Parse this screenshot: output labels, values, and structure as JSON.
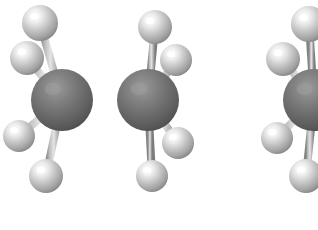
{
  "figure": {
    "kind": "molecular-ball-and-stick-render",
    "formula": "C2H6",
    "conformer_count": 2,
    "background_color": "#ffffff",
    "canvas": {
      "width": 318,
      "height": 230
    }
  },
  "palette": {
    "carbon_base": "#6a6a6a",
    "carbon_highlight": "#8e8e8e",
    "carbon_shadow": "#4a4a4a",
    "hydrogen_base": "#b6b6b6",
    "hydrogen_highlight": "#ffffff",
    "hydrogen_shadow": "#8c8c8c",
    "bond_base": "#9a9a9a",
    "bond_highlight": "#d8d8d8",
    "bond_shadow": "#6e6e6e",
    "cc_bond_base": "#7e7e7e",
    "cc_bond_highlight": "#a8a8a8"
  },
  "molecules": [
    {
      "id": "left-molecule",
      "label": "ethane-staggered-left",
      "clipped": false,
      "atoms": [
        {
          "id": "C1",
          "element": "C",
          "name": "carbon-atom-left",
          "cx": 62,
          "cy": 100,
          "r": 31
        },
        {
          "id": "C2",
          "element": "C",
          "name": "carbon-atom-right",
          "cx": 148,
          "cy": 100,
          "r": 31
        },
        {
          "id": "H1",
          "element": "H",
          "name": "hydrogen-atom-top-left",
          "cx": 40,
          "cy": 23,
          "r": 18
        },
        {
          "id": "H2",
          "element": "H",
          "name": "hydrogen-atom-upper-left",
          "cx": 27,
          "cy": 58,
          "r": 17
        },
        {
          "id": "H3",
          "element": "H",
          "name": "hydrogen-atom-lower-left",
          "cx": 19,
          "cy": 136,
          "r": 16
        },
        {
          "id": "H4",
          "element": "H",
          "name": "hydrogen-atom-bottom-left",
          "cx": 46,
          "cy": 176,
          "r": 17
        },
        {
          "id": "H5",
          "element": "H",
          "name": "hydrogen-atom-top-right",
          "cx": 155,
          "cy": 27,
          "r": 17
        },
        {
          "id": "H6",
          "element": "H",
          "name": "hydrogen-atom-upper-right",
          "cx": 176,
          "cy": 60,
          "r": 16
        },
        {
          "id": "H7",
          "element": "H",
          "name": "hydrogen-atom-lower-right",
          "cx": 178,
          "cy": 143,
          "r": 16
        },
        {
          "id": "H8",
          "element": "H",
          "name": "hydrogen-atom-bottom-right",
          "cx": 152,
          "cy": 176,
          "r": 16
        }
      ],
      "bonds": [
        {
          "id": "B-CC",
          "from": "C1",
          "to": "C2",
          "kind": "carbon-carbon",
          "width": 17
        },
        {
          "id": "B1",
          "from": "C1",
          "to": "H1",
          "kind": "carbon-hydrogen",
          "width": 8
        },
        {
          "id": "B2",
          "from": "C1",
          "to": "H2",
          "kind": "carbon-hydrogen",
          "width": 8
        },
        {
          "id": "B3",
          "from": "C1",
          "to": "H3",
          "kind": "carbon-hydrogen",
          "width": 8
        },
        {
          "id": "B4",
          "from": "C1",
          "to": "H4",
          "kind": "carbon-hydrogen",
          "width": 8
        },
        {
          "id": "B5",
          "from": "C2",
          "to": "H5",
          "kind": "carbon-hydrogen",
          "width": 8
        },
        {
          "id": "B6",
          "from": "C2",
          "to": "H6",
          "kind": "carbon-hydrogen",
          "width": 8
        },
        {
          "id": "B7",
          "from": "C2",
          "to": "H7",
          "kind": "carbon-hydrogen",
          "width": 8
        },
        {
          "id": "B8",
          "from": "C2",
          "to": "H8",
          "kind": "carbon-hydrogen",
          "width": 8
        }
      ]
    },
    {
      "id": "right-molecule",
      "label": "ethane-eclipsed-right-cropped",
      "clipped": true,
      "atoms": [
        {
          "id": "C1b",
          "element": "C",
          "name": "carbon-atom-left",
          "cx": 314,
          "cy": 100,
          "r": 31
        },
        {
          "id": "H1b",
          "element": "H",
          "name": "hydrogen-atom-top-left",
          "cx": 309,
          "cy": 24,
          "r": 18
        },
        {
          "id": "H2b",
          "element": "H",
          "name": "hydrogen-atom-upper-left",
          "cx": 283,
          "cy": 59,
          "r": 17
        },
        {
          "id": "H3b",
          "element": "H",
          "name": "hydrogen-atom-lower-left",
          "cx": 277,
          "cy": 138,
          "r": 16
        },
        {
          "id": "H4b",
          "element": "H",
          "name": "hydrogen-atom-bottom-left",
          "cx": 306,
          "cy": 176,
          "r": 17
        }
      ],
      "bonds": [
        {
          "id": "B1b",
          "from": "C1b",
          "to": "H1b",
          "kind": "carbon-hydrogen",
          "width": 8
        },
        {
          "id": "B2b",
          "from": "C1b",
          "to": "H2b",
          "kind": "carbon-hydrogen",
          "width": 8
        },
        {
          "id": "B3b",
          "from": "C1b",
          "to": "H3b",
          "kind": "carbon-hydrogen",
          "width": 8
        },
        {
          "id": "B4b",
          "from": "C1b",
          "to": "H4b",
          "kind": "carbon-hydrogen",
          "width": 8
        }
      ]
    }
  ]
}
